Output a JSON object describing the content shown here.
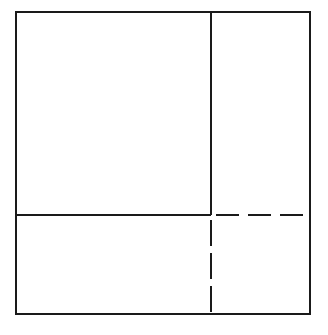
{
  "figure": {
    "type": "geometric-diagram",
    "title": "",
    "caption": "",
    "background_color": "#ffffff",
    "stroke_color": "#1a1a1a",
    "canvas": {
      "width": 328,
      "height": 335
    }
  },
  "chart_data": {
    "type": "diagram",
    "title": "",
    "xlabel": "",
    "ylabel": "",
    "coordinate_space": {
      "x": [
        0,
        328
      ],
      "y": [
        0,
        335
      ]
    },
    "grid": false,
    "legend": null,
    "shapes": [
      {
        "name": "outer-square",
        "kind": "rectangle",
        "style": "solid",
        "x": 16,
        "y": 12,
        "width": 294,
        "height": 302,
        "stroke_width": 2.6
      },
      {
        "name": "vertical-divider-solid",
        "kind": "line",
        "style": "solid",
        "x1": 211,
        "y1": 12,
        "x2": 211,
        "y2": 215,
        "stroke_width": 2.6
      },
      {
        "name": "horizontal-divider-solid",
        "kind": "line",
        "style": "solid",
        "x1": 16,
        "y1": 215,
        "x2": 211,
        "y2": 215,
        "stroke_width": 2.6
      },
      {
        "name": "horizontal-divider-dashed",
        "kind": "line",
        "style": "dashed",
        "x1": 216,
        "y1": 215,
        "x2": 310,
        "y2": 215,
        "stroke_width": 2.6,
        "dash_length": 23,
        "gap_length": 9
      },
      {
        "name": "vertical-divider-dashed",
        "kind": "line",
        "style": "dashed",
        "x1": 211,
        "y1": 220,
        "x2": 211,
        "y2": 314,
        "stroke_width": 2.6,
        "dash_length": 26,
        "gap_length": 7
      }
    ],
    "regions": [
      {
        "name": "upper-left-region",
        "x": 16,
        "y": 12,
        "width": 195,
        "height": 203
      },
      {
        "name": "upper-right-region",
        "x": 211,
        "y": 12,
        "width": 99,
        "height": 203
      },
      {
        "name": "lower-left-region",
        "x": 16,
        "y": 215,
        "width": 195,
        "height": 99
      },
      {
        "name": "lower-right-region",
        "x": 211,
        "y": 215,
        "width": 99,
        "height": 99
      }
    ],
    "labels": [],
    "annotations": []
  }
}
